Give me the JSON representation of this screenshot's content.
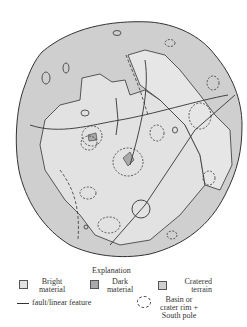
{
  "figure": {
    "type": "geologic map of a planetary body",
    "colors": {
      "bright_material": "#e2e2e2",
      "dark_material": "#a9a9a9",
      "cratered_terrain": "#cfcfcf",
      "outline": "#333333"
    }
  },
  "legend": {
    "title": "Explanation",
    "items": [
      {
        "key": "bright",
        "label_line1": "Bright",
        "label_line2": "material",
        "swatch": "#e2e2e2"
      },
      {
        "key": "dark",
        "label_line1": "Dark",
        "label_line2": "material",
        "swatch": "#a9a9a9"
      },
      {
        "key": "cratered",
        "label_line1": "Cratered",
        "label_line2": "terrain",
        "swatch": "#cfcfcf"
      },
      {
        "key": "fault",
        "label": "fault/linear feature"
      },
      {
        "key": "basin",
        "label_line1": "Basin or",
        "label_line2": "crater rim +",
        "label_line3": "South pole"
      }
    ]
  }
}
